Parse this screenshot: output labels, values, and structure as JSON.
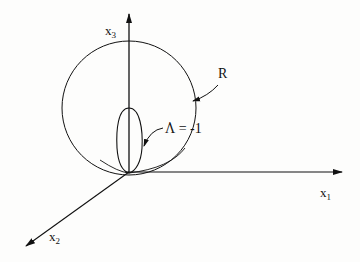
{
  "figure": {
    "axes": {
      "x1": {
        "label": "x",
        "subscript": "1"
      },
      "x2": {
        "label": "x",
        "subscript": "2"
      },
      "x3": {
        "label": "x",
        "subscript": "3"
      }
    },
    "annotations": {
      "sphere": {
        "label": "R"
      },
      "surface": {
        "symbol": "Λ",
        "relation": "= -1"
      }
    },
    "colors": {
      "ink": "#111111",
      "background": "#fdfdfc"
    }
  }
}
